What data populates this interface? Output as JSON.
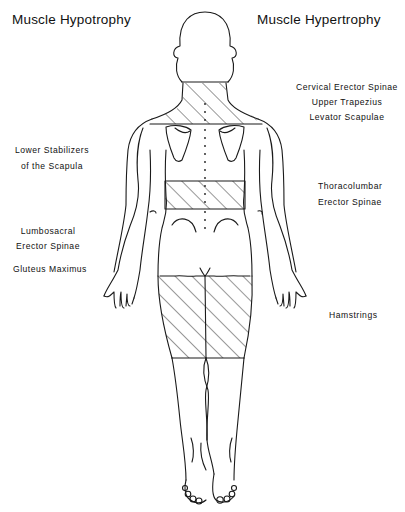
{
  "titles": {
    "left": "Muscle Hypotrophy",
    "right": "Muscle Hypertrophy"
  },
  "hypotrophy_labels": [
    {
      "lines": [
        "Lower Stabilizers",
        "of the Scapula"
      ]
    },
    {
      "lines": [
        "Lumbosacral",
        "Erector Spinae"
      ]
    },
    {
      "lines": [
        "Gluteus  Maximus"
      ]
    }
  ],
  "hypertrophy_labels": [
    {
      "lines": [
        "Cervical Erector Spinae",
        "Upper Trapezius",
        "Levator Scapulae"
      ]
    },
    {
      "lines": [
        "Thoracolumbar",
        "Erector Spinae"
      ]
    },
    {
      "lines": [
        "Hamstrings"
      ]
    }
  ],
  "figure": {
    "view": "posterior",
    "hatched_regions": [
      "neck-upper-trapezius",
      "thoracolumbar-band",
      "hamstrings"
    ]
  }
}
